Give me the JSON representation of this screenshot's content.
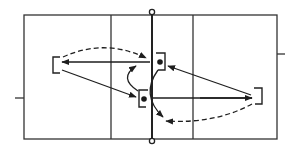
{
  "diagram": {
    "type": "volleyball-court-play-diagram",
    "colors": {
      "line": "#2a2a2a",
      "background": "#ffffff"
    },
    "court": {
      "left": 24,
      "top": 15,
      "right": 277,
      "bottom": 139,
      "net_x": 152,
      "attack_lines_x": [
        111,
        193
      ],
      "side_ticks": [
        {
          "side": "left",
          "x1": 15,
          "x2": 24,
          "y": 98
        },
        {
          "side": "right",
          "x1": 277,
          "x2": 285,
          "y": 54
        }
      ]
    },
    "players": [
      {
        "id": "player-left-back",
        "bracket_opens": "right",
        "x": 53,
        "y": 57,
        "w": 8,
        "h": 16,
        "has_ball": false
      },
      {
        "id": "player-right-front",
        "bracket_opens": "left",
        "x": 155,
        "y": 53,
        "w": 10,
        "h": 17,
        "has_ball": true,
        "dot": [
          160,
          62
        ]
      },
      {
        "id": "player-left-front",
        "bracket_opens": "right",
        "x": 139,
        "y": 90,
        "w": 10,
        "h": 17,
        "has_ball": true,
        "dot": [
          144,
          99
        ]
      },
      {
        "id": "player-right-back",
        "bracket_opens": "left",
        "x": 254,
        "y": 88,
        "w": 8,
        "h": 16,
        "has_ball": false
      }
    ],
    "movements": [
      {
        "id": "pass-to-left-back",
        "style": "solid",
        "from": "net area",
        "to": "player-left-back"
      },
      {
        "id": "pass-left-back-to-left-front",
        "style": "solid",
        "from": "player-left-back",
        "to": "player-left-front"
      },
      {
        "id": "pass-right-back-to-net",
        "style": "solid",
        "from": "player-right-back",
        "to": "net"
      },
      {
        "id": "pass-right-back-to-right-front",
        "style": "solid",
        "from": "player-right-back",
        "to": "player-right-front"
      },
      {
        "id": "run-left-back-to-net",
        "style": "dashed",
        "from": "player-left-back",
        "to": "net top"
      },
      {
        "id": "run-right-back-to-net",
        "style": "dashed",
        "from": "player-right-back",
        "to": "net bottom"
      },
      {
        "id": "switch-left-front-up",
        "style": "solid-curved",
        "from": "player-left-front",
        "to": "net top-left"
      },
      {
        "id": "switch-right-front-down",
        "style": "solid-curved",
        "from": "player-right-front",
        "to": "net bottom-right"
      }
    ]
  }
}
